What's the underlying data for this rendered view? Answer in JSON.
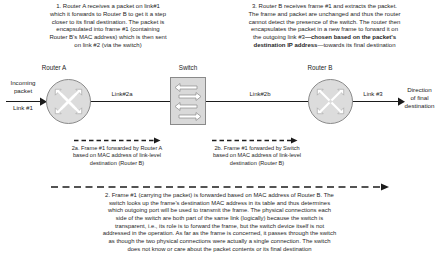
{
  "figure": {
    "background_color": "#ffffff",
    "node_fill_color": "#dcdcdc",
    "node_stroke_color": "#8a8a8a",
    "line_color": "#1b1b1b"
  },
  "annotations": {
    "step1": {
      "lines": [
        "1. Router A receives a packet on link#1",
        "which it forwards to Router B to get it a step",
        "closer to its final destination. The packet is",
        "encapsulated into frame #1 (containing",
        "Router B's MAC address) which is then sent",
        "on link #2 (via the switch)"
      ]
    },
    "step3": {
      "lines": [
        "3. Router B receives frame #1 and extracts the packet.",
        "The frame and packet are unchanged and thus the router",
        "cannot detect the presence of the switch. The router then",
        "encapsulates the packet in a new frame to forward it on"
      ],
      "line5_prefix": "the outgoing link #3",
      "line5_bold": "—chosen based on the packet's",
      "line6_bold": "destination IP address",
      "line6_suffix": "—towards its final destination"
    },
    "step2a": {
      "lines": [
        "2a. Frame #1 forwarded by Router A",
        "based on MAC address of link-level",
        "destination (Router B)"
      ]
    },
    "step2b": {
      "lines": [
        "2b. Frame #1 forwarded by Switch",
        "based on MAC address of link-level",
        "destination (Router B)"
      ]
    },
    "step2": {
      "lines": [
        "2. Frame #1 (carrying the packet) is forwarded based on MAC address of Router B. The",
        "switch looks up the frame's destination MAC address in its table and thus determines",
        "which outgoing port will be used to transmit the frame. The physical connections each",
        "side of the switch are both part of the same link (logically) because the switch is",
        "transparent, i.e., its role is to forward the frame, but the switch device itself is not",
        "addressed in the operation. As far as the frame is concerned, it passes through the switch",
        "as though the two physical connections were actually a single connection. The switch",
        "does not know or care about the packet contents or its final destination"
      ]
    }
  },
  "nodes": {
    "router_a": {
      "label": "Router A",
      "icon": "router-icon"
    },
    "switch": {
      "label": "Switch",
      "icon": "switch-icon"
    },
    "router_b": {
      "label": "Router B",
      "icon": "router-icon"
    }
  },
  "edges": {
    "incoming": {
      "line1": "Incoming",
      "line2": "packet",
      "line3": "Link #1"
    },
    "link2a": "Link#2a",
    "link2b": "Link#2b",
    "link3": "Link #3",
    "outgoing": {
      "line1": "Direction",
      "line2": "of final",
      "line3": "destination"
    }
  }
}
